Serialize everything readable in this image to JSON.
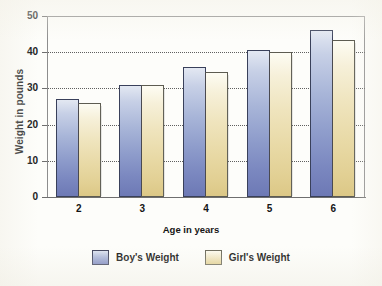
{
  "chart_data": {
    "type": "bar",
    "title": "",
    "xlabel": "Age in years",
    "ylabel": "Weight in pounds",
    "categories": [
      "2",
      "3",
      "4",
      "5",
      "6"
    ],
    "series": [
      {
        "name": "Boy's Weight",
        "color": "#8e9ccb",
        "values": [
          27,
          31,
          36,
          40.5,
          46
        ]
      },
      {
        "name": "Girl's Weight",
        "color": "#e8d9a5",
        "values": [
          26,
          31,
          34.5,
          40,
          43.5
        ]
      }
    ],
    "ylim": [
      0,
      50
    ],
    "yticks": [
      0,
      10,
      20,
      30,
      40,
      50
    ],
    "ytick_labels": [
      "0",
      "10",
      "20",
      "30",
      "40",
      "50"
    ],
    "xtick_labels": [
      "2",
      "3",
      "4",
      "5",
      "6"
    ],
    "grid": true,
    "grid_style": "dotted-horizontal",
    "legend": {
      "position": "bottom-center",
      "entries": [
        "Boy's Weight",
        "Girl's Weight"
      ]
    }
  },
  "axes": {
    "y_title": "Weight in pounds",
    "x_title": "Age in years"
  }
}
